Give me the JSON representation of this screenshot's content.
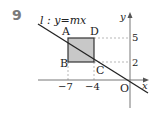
{
  "problem": {
    "number": "9"
  },
  "diagram": {
    "line_label": "l : y=mx",
    "line_name": "l",
    "line_equation": "y=mx",
    "axes": {
      "x_label": "x",
      "y_label": "y",
      "origin_label": "O"
    },
    "x_ticks": [
      "−7",
      "−4"
    ],
    "y_ticks": [
      "5",
      "2"
    ],
    "points": {
      "A": {
        "label": "A",
        "x": -7,
        "y": 5
      },
      "B": {
        "label": "B",
        "x": -7,
        "y": 2
      },
      "C": {
        "label": "C",
        "x": -4,
        "y": 2
      },
      "D": {
        "label": "D",
        "x": -4,
        "y": 5
      }
    },
    "shaded_region": "rectangle ABCD",
    "colors": {
      "fill": "#c8c8c8",
      "stroke": "#333333",
      "dashed": "#999999",
      "number": "#7a7a7a"
    }
  }
}
